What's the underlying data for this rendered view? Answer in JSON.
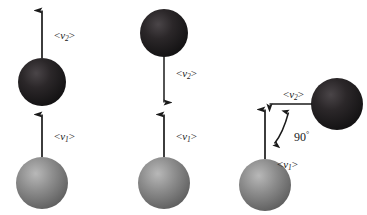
{
  "figure": {
    "background_color": "#ffffff",
    "width": 367,
    "height": 215
  },
  "colors": {
    "dark_sphere": "#231f20",
    "dark_sphere_highlight": "#4a4548",
    "dark_sphere_shadow": "#111011",
    "light_sphere": "#8a8a8a",
    "light_sphere_highlight": "#b4b4b4",
    "light_sphere_shadow": "#5e5e5e",
    "arrow": "#1a1a1a",
    "label_text": "#1a1a1a"
  },
  "labels": {
    "v1": {
      "open": "<",
      "symbol": "v",
      "sub": "1",
      "close": ">"
    },
    "v2": {
      "open": "<",
      "symbol": "v",
      "sub": "2",
      "close": ">"
    },
    "angle": "90",
    "degree_sign": "°"
  },
  "panels": [
    {
      "id": "panel-1",
      "name": "head-on-same-direction",
      "spheres": [
        {
          "name": "dark-sphere",
          "shade": "dark",
          "cx": 42,
          "cy": 82,
          "r": 24
        },
        {
          "name": "light-sphere",
          "shade": "light",
          "cx": 42,
          "cy": 183,
          "r": 26
        }
      ],
      "vectors": [
        {
          "name": "v2-vector",
          "label": "v2",
          "direction": "up",
          "x": 42,
          "from_y": 58,
          "to_y": 8,
          "label_x": 55,
          "label_y": 36
        },
        {
          "name": "v1-vector",
          "label": "v1",
          "direction": "up",
          "x": 42,
          "from_y": 157,
          "to_y": 112,
          "label_x": 55,
          "label_y": 137
        }
      ]
    },
    {
      "id": "panel-2",
      "name": "rebound-opposite-direction",
      "spheres": [
        {
          "name": "dark-sphere",
          "shade": "dark",
          "cx": 164,
          "cy": 33,
          "r": 24
        },
        {
          "name": "light-sphere",
          "shade": "light",
          "cx": 164,
          "cy": 183,
          "r": 26
        }
      ],
      "vectors": [
        {
          "name": "v2-vector",
          "label": "v2",
          "direction": "down",
          "x": 164,
          "from_y": 57,
          "to_y": 105,
          "label_x": 177,
          "label_y": 74
        },
        {
          "name": "v1-vector",
          "label": "v1",
          "direction": "up",
          "x": 164,
          "from_y": 157,
          "to_y": 112,
          "label_x": 177,
          "label_y": 137
        }
      ]
    },
    {
      "id": "panel-3",
      "name": "right-angle-deflection",
      "spheres": [
        {
          "name": "dark-sphere",
          "shade": "dark",
          "cx": 337,
          "cy": 104,
          "r": 26
        },
        {
          "name": "light-sphere",
          "shade": "light",
          "cx": 265,
          "cy": 185,
          "r": 26
        }
      ],
      "vectors": [
        {
          "name": "v2-vector",
          "label": "v2",
          "direction": "left",
          "y": 104,
          "from_x": 311,
          "to_x": 267,
          "label_x": 288,
          "label_y": 96
        },
        {
          "name": "v1-vector",
          "label": "v1",
          "direction": "up",
          "x": 265,
          "from_y": 159,
          "to_y": 107,
          "label_x": 278,
          "label_y": 166
        }
      ],
      "angle_marker": {
        "name": "right-angle-arc",
        "value": "90",
        "label_x": 296,
        "label_y": 137,
        "double_headed": true
      }
    }
  ]
}
